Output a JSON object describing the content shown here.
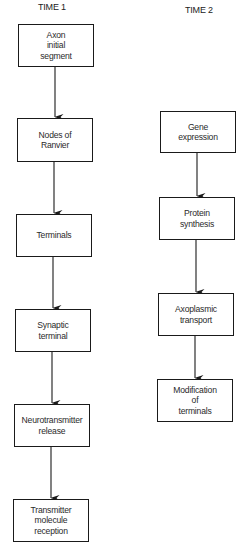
{
  "diagram": {
    "columns": [
      {
        "title": "TIME 1",
        "nodes": [
          {
            "id": "axon-initial-segment",
            "label": "Axon\ninitial\nsegment"
          },
          {
            "id": "nodes-of-ranvier",
            "label": "Nodes of\nRanvier"
          },
          {
            "id": "terminals",
            "label": "Terminals"
          },
          {
            "id": "synaptic-terminal",
            "label": "Synaptic\nterminal"
          },
          {
            "id": "neurotransmitter-release",
            "label": "Neurotransmitter\nrelease"
          },
          {
            "id": "transmitter-molecule-reception",
            "label": "Transmitter\nmolecule\nreception"
          }
        ]
      },
      {
        "title": "TIME 2",
        "nodes": [
          {
            "id": "gene-expression",
            "label": "Gene\nexpression"
          },
          {
            "id": "protein-synthesis",
            "label": "Protein\nsynthesis"
          },
          {
            "id": "axoplasmic-transport",
            "label": "Axoplasmic\ntransport"
          },
          {
            "id": "modification-of-terminals",
            "label": "Modification\nof\nterminals"
          }
        ]
      }
    ],
    "edges": [
      {
        "from": "axon-initial-segment",
        "to": "nodes-of-ranvier"
      },
      {
        "from": "nodes-of-ranvier",
        "to": "terminals"
      },
      {
        "from": "terminals",
        "to": "synaptic-terminal"
      },
      {
        "from": "synaptic-terminal",
        "to": "neurotransmitter-release"
      },
      {
        "from": "neurotransmitter-release",
        "to": "transmitter-molecule-reception"
      },
      {
        "from": "gene-expression",
        "to": "protein-synthesis"
      },
      {
        "from": "protein-synthesis",
        "to": "axoplasmic-transport"
      },
      {
        "from": "axoplasmic-transport",
        "to": "modification-of-terminals"
      }
    ],
    "colors": {
      "line": "#1a1a1a",
      "background": "#ffffff"
    }
  }
}
